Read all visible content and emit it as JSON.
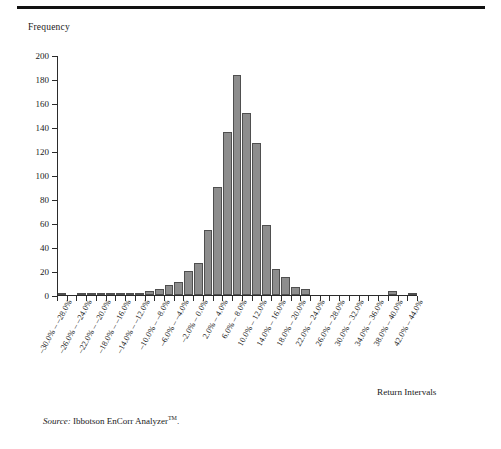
{
  "figure": {
    "source_prefix": "Source:",
    "source_text": " Ibbotson EnCorr Analyzer",
    "source_tm": "TM",
    "source_suffix": "."
  },
  "chart_data": {
    "type": "bar",
    "title": "",
    "xlabel": "Return Intervals",
    "ylabel": "Frequency",
    "ylim": [
      0,
      200
    ],
    "ytick_values": [
      0,
      20,
      40,
      60,
      80,
      100,
      120,
      140,
      160,
      180,
      200
    ],
    "ytick_labels": [
      "0",
      "20",
      "40",
      "60",
      "80",
      "100",
      "120",
      "140",
      "160",
      "180",
      "200"
    ],
    "grid": false,
    "legend": "none",
    "bar_color": "#8d8d8d",
    "bar_edge_color": "#4f4f4f",
    "categories": [
      "–30.0% – –28.0%",
      "–28.0% – –26.0%",
      "–26.0% – –24.0%",
      "–24.0% – –22.0%",
      "–22.0% – –20.0%",
      "–20.0% – –18.0%",
      "–18.0% – –16.0%",
      "–16.0% – –14.0%",
      "–14.0% – –12.0%",
      "–12.0% – –10.0%",
      "–10.0% – –8.0%",
      "–8.0% – –6.0%",
      "–6.0% – –4.0%",
      "–4.0% – –2.0%",
      "–2.0% – 0.0%",
      "0.0% – 2.0%",
      "2.0% – 4.0%",
      "4.0% – 6.0%",
      "6.0% – 8.0%",
      "8.0% – 10.0%",
      "10.0% – 12.0%",
      "12.0% – 14.0%",
      "14.0% – 16.0%",
      "16.0% – 18.0%",
      "18.0% – 20.0%",
      "20.0% – 22.0%",
      "22.0% – 24.0%",
      "24.0% – 26.0%",
      "26.0% – 28.0%",
      "28.0% – 30.0%",
      "30.0% – 32.0%",
      "32.0% – 34.0%",
      "34.0% – 36.0%",
      "36.0% – 38.0%",
      "38.0% – 40.0%",
      "40.0% – 42.0%",
      "42.0% – 44.0%"
    ],
    "values": [
      2,
      0,
      1,
      1,
      2,
      2,
      1,
      1,
      2,
      3,
      5,
      8,
      11,
      20,
      27,
      54,
      90,
      136,
      183,
      152,
      127,
      58,
      22,
      15,
      7,
      5,
      0,
      0,
      0,
      0,
      0,
      0,
      0,
      0,
      3,
      0,
      2
    ],
    "xtick_labels_shown": [
      "–30.0% – –28.0%",
      "–26.0% – –24.0%",
      "–22.0% – –20.0%",
      "–18.0% – –16.0%",
      "–14.0% – –12.0%",
      "–10.0% – –8.0%",
      "–6.0% – –4.0%",
      "–2.0% – 0.0%",
      "2.0% – 4.0%",
      "6.0% – 8.0%",
      "10.0% – 12.0%",
      "14.0% – 16.0%",
      "18.0% – 20.0%",
      "22.0% – 24.0%",
      "26.0% – 28.0%",
      "30.0% – 32.0%",
      "34.0% – 36.0%",
      "38.0% – 40.0%",
      "42.0% – 44.0%"
    ]
  }
}
